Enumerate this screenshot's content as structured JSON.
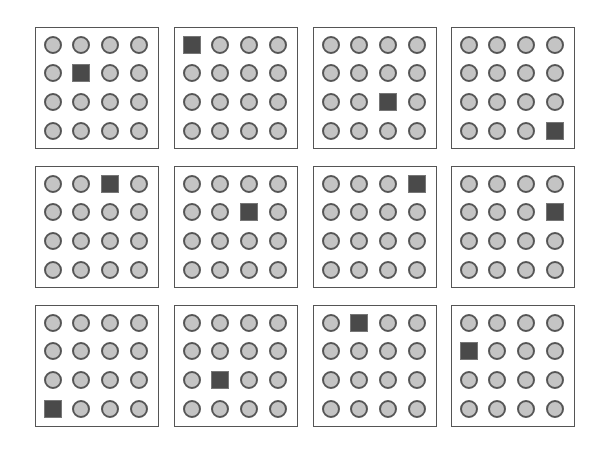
{
  "diagram": {
    "grid_rows": 3,
    "grid_cols": 4,
    "cells_per_panel": [
      4,
      4
    ],
    "colors": {
      "circle_fill": "#c4c4c4",
      "circle_stroke": "#555555",
      "square_fill": "#4a4a4a",
      "panel_border": "#555555"
    },
    "panels": [
      {
        "square": [
          1,
          1
        ]
      },
      {
        "square": [
          0,
          0
        ]
      },
      {
        "square": [
          2,
          2
        ]
      },
      {
        "square": [
          3,
          3
        ]
      },
      {
        "square": [
          0,
          2
        ]
      },
      {
        "square": [
          1,
          2
        ]
      },
      {
        "square": [
          0,
          3
        ]
      },
      {
        "square": [
          1,
          3
        ]
      },
      {
        "square": [
          3,
          0
        ]
      },
      {
        "square": [
          2,
          1
        ]
      },
      {
        "square": [
          0,
          1
        ]
      },
      {
        "square": [
          1,
          0
        ]
      }
    ]
  }
}
